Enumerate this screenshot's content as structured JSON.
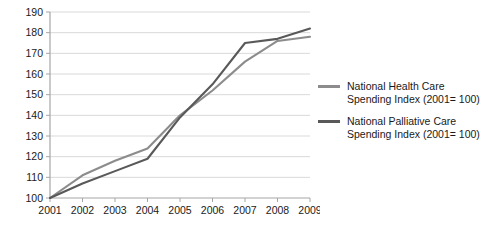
{
  "chart_data": {
    "type": "line",
    "title": "",
    "xlabel": "",
    "ylabel": "",
    "categories": [
      "2001",
      "2002",
      "2003",
      "2004",
      "2005",
      "2006",
      "2007",
      "2008",
      "2009"
    ],
    "ylim": [
      100,
      190
    ],
    "ytick_step": 10,
    "yticks": [
      "100",
      "110",
      "120",
      "130",
      "140",
      "150",
      "160",
      "170",
      "180",
      "190"
    ],
    "grid": "horizontal",
    "legend_position": "right",
    "series": [
      {
        "name": "National Health Care Spending Index (2001= 100)",
        "color": "#8c8c8c",
        "values": [
          100,
          111,
          118,
          124,
          140,
          152,
          166,
          176,
          178
        ]
      },
      {
        "name": "National Palliative Care Spending Index (2001= 100)",
        "color": "#595959",
        "values": [
          100,
          107,
          113,
          119,
          139,
          155,
          175,
          177,
          182
        ]
      }
    ]
  },
  "legend": {
    "entries": [
      {
        "label": "National Health Care\nSpending Index (2001= 100)",
        "color": "#8c8c8c"
      },
      {
        "label": "National Palliative Care\nSpending Index (2001= 100)",
        "color": "#595959"
      }
    ]
  },
  "colors": {
    "gridline": "#d9d9d9",
    "axis": "#a6a6a6",
    "text": "#1a1a1a",
    "background": "#ffffff"
  }
}
